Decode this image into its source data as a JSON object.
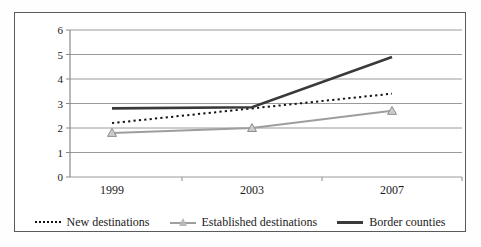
{
  "chart_data": {
    "type": "line",
    "categories": [
      "1999",
      "2003",
      "2007"
    ],
    "series": [
      {
        "name": "New destinations",
        "values": [
          2.2,
          2.8,
          3.4
        ],
        "style": "dotted",
        "color": "#141414"
      },
      {
        "name": "Established destinations",
        "values": [
          1.8,
          2.0,
          2.7
        ],
        "style": "solid-with-triangle-markers",
        "color": "#9e9e9e"
      },
      {
        "name": "Border counties",
        "values": [
          2.8,
          2.85,
          4.9
        ],
        "style": "solid-thick",
        "color": "#3a3a3a"
      }
    ],
    "title": "",
    "xlabel": "",
    "ylabel": "",
    "ylim": [
      0,
      6
    ],
    "y_ticks": [
      0,
      1,
      2,
      3,
      4,
      5,
      6
    ],
    "grid": true,
    "legend_position": "bottom"
  },
  "colors": {
    "grid": "#9a9a9a",
    "axis": "#8a8a8a",
    "text": "#1a1a1a",
    "frame": "#5a5a5a",
    "triangle_fill": "#cccccc",
    "triangle_stroke": "#8f8f8f"
  }
}
